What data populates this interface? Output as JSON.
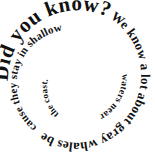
{
  "graphic": {
    "type": "spiral-text",
    "background_color": "#ffffff",
    "text_color": "#111111",
    "full_text": "Did you know? We know a lot about gray whales because they stay in shallow waters near the coast.",
    "direction": "clockwise-inward",
    "segments": [
      {
        "id": "title",
        "text": "Did you know?",
        "font_size": 21,
        "letter_spacing": 0.5
      },
      {
        "id": "turn-1",
        "text": "We know a lot about gray whales be",
        "font_size": 13,
        "letter_spacing": 0.2
      },
      {
        "id": "turn-2",
        "text": "cause they stay in shallow",
        "font_size": 11,
        "letter_spacing": 0.2
      },
      {
        "id": "turn-3",
        "text": "waters near",
        "font_size": 9.5,
        "letter_spacing": 0.2
      },
      {
        "id": "turn-4",
        "text": "the coast.",
        "font_size": 9,
        "letter_spacing": 0.2
      }
    ]
  }
}
